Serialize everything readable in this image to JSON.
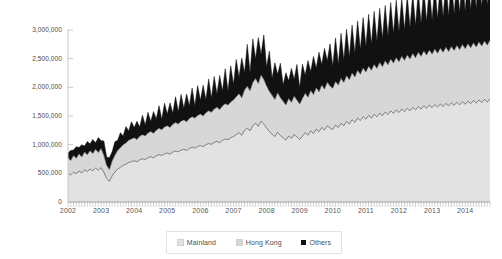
{
  "chart_data": {
    "type": "area",
    "title": "",
    "xlabel": "",
    "ylabel": "",
    "stacked": true,
    "grid": false,
    "legend_position": "bottom",
    "ylim": [
      0,
      3000000
    ],
    "ytick_labels": [
      "3,000,000",
      "2,500,000",
      "2,000,000",
      "1,500,000",
      "1,000,000",
      "500,000",
      "0"
    ],
    "ytick_values": [
      3000000,
      2500000,
      2000000,
      1500000,
      1000000,
      500000,
      0
    ],
    "xtick_labels": [
      "2002",
      "2003",
      "2004",
      "2005",
      "2006",
      "2007",
      "2008",
      "2009",
      "2010",
      "2011",
      "2012",
      "2013",
      "2014"
    ],
    "x_start_year": 2002,
    "x_end_year": 2014,
    "x_frequency": "monthly",
    "colors": {
      "mainland": "#e2e2e2",
      "hong_kong": "#d7d7d7",
      "others": "#111111",
      "axis": "#c8c8c8",
      "line": "#3a3a3a",
      "text": "#4d4d4d"
    },
    "series": [
      {
        "name": "Mainland",
        "color": "#e2e2e2",
        "values": [
          500000,
          470000,
          520000,
          495000,
          540000,
          505000,
          560000,
          530000,
          575000,
          545000,
          590000,
          555000,
          600000,
          520000,
          410000,
          360000,
          455000,
          520000,
          575000,
          605000,
          640000,
          660000,
          690000,
          705000,
          720000,
          700000,
          735000,
          755000,
          740000,
          775000,
          790000,
          770000,
          805000,
          825000,
          810000,
          840000,
          855000,
          835000,
          870000,
          890000,
          875000,
          905000,
          920000,
          900000,
          935000,
          955000,
          940000,
          970000,
          985000,
          965000,
          1000000,
          1020000,
          1005000,
          1040000,
          1060000,
          1035000,
          1075000,
          1100000,
          1085000,
          1120000,
          1140000,
          1175000,
          1210000,
          1165000,
          1250000,
          1290000,
          1240000,
          1330000,
          1375000,
          1320000,
          1410000,
          1360000,
          1290000,
          1230000,
          1185000,
          1140000,
          1215000,
          1160000,
          1120000,
          1080000,
          1150000,
          1110000,
          1175000,
          1135000,
          1090000,
          1150000,
          1210000,
          1165000,
          1240000,
          1195000,
          1270000,
          1225000,
          1300000,
          1255000,
          1330000,
          1290000,
          1265000,
          1340000,
          1300000,
          1375000,
          1330000,
          1405000,
          1360000,
          1435000,
          1390000,
          1465000,
          1420000,
          1490000,
          1445000,
          1510000,
          1465000,
          1530000,
          1485000,
          1550000,
          1505000,
          1570000,
          1525000,
          1590000,
          1545000,
          1605000,
          1560000,
          1620000,
          1575000,
          1635000,
          1590000,
          1650000,
          1605000,
          1665000,
          1620000,
          1680000,
          1635000,
          1690000,
          1645000,
          1700000,
          1655000,
          1710000,
          1665000,
          1720000,
          1675000,
          1730000,
          1685000,
          1740000,
          1695000,
          1750000,
          1705000,
          1760000,
          1715000,
          1770000,
          1725000,
          1780000,
          1735000,
          1790000,
          1745000,
          1800000
        ]
      },
      {
        "name": "Hong Kong",
        "color": "#d7d7d7",
        "values": [
          270000,
          255000,
          290000,
          270000,
          300000,
          280000,
          310000,
          295000,
          320000,
          300000,
          330000,
          310000,
          335000,
          295000,
          230000,
          205000,
          260000,
          295000,
          325000,
          340000,
          360000,
          370000,
          385000,
          395000,
          400000,
          390000,
          410000,
          420000,
          412000,
          430000,
          440000,
          428000,
          448000,
          460000,
          450000,
          468000,
          475000,
          465000,
          485000,
          495000,
          487000,
          505000,
          512000,
          500000,
          520000,
          532000,
          523000,
          540000,
          548000,
          537000,
          558000,
          570000,
          560000,
          580000,
          592000,
          578000,
          600000,
          615000,
          605000,
          625000,
          640000,
          660000,
          680000,
          655000,
          705000,
          730000,
          700000,
          755000,
          780000,
          748000,
          805000,
          775000,
          735000,
          700000,
          675000,
          648000,
          692000,
          660000,
          637000,
          614000,
          654000,
          630000,
          668000,
          645000,
          620000,
          654000,
          688000,
          662000,
          705000,
          679000,
          722000,
          696000,
          740000,
          713000,
          757000,
          733000,
          719000,
          762000,
          739000,
          782000,
          756000,
          799000,
          773000,
          816000,
          790000,
          833000,
          807000,
          847000,
          822000,
          859000,
          833000,
          870000,
          845000,
          882000,
          856000,
          893000,
          868000,
          904000,
          879000,
          913000,
          887000,
          921000,
          896000,
          930000,
          904000,
          938000,
          912000,
          947000,
          921000,
          955000,
          929000,
          961000,
          935000,
          967000,
          941000,
          972000,
          947000,
          978000,
          952000,
          984000,
          958000,
          989000,
          964000,
          995000,
          969000,
          1001000,
          975000,
          1006000,
          980000,
          1012000,
          986000,
          1017000,
          991000,
          1023000
        ]
      },
      {
        "name": "Others",
        "color": "#111111",
        "values": [
          85000,
          175000,
          95000,
          200000,
          110000,
          215000,
          105000,
          230000,
          120000,
          245000,
          115000,
          260000,
          135000,
          250000,
          145000,
          205000,
          160000,
          235000,
          175000,
          265000,
          150000,
          285000,
          165000,
          300000,
          180000,
          320000,
          165000,
          340000,
          190000,
          360000,
          175000,
          380000,
          200000,
          395000,
          185000,
          415000,
          205000,
          430000,
          195000,
          450000,
          215000,
          465000,
          205000,
          485000,
          225000,
          500000,
          215000,
          520000,
          240000,
          535000,
          225000,
          555000,
          250000,
          570000,
          235000,
          595000,
          260000,
          610000,
          245000,
          630000,
          275000,
          650000,
          290000,
          690000,
          305000,
          730000,
          320000,
          760000,
          345000,
          800000,
          360000,
          780000,
          330000,
          700000,
          300000,
          640000,
          320000,
          600000,
          290000,
          560000,
          310000,
          590000,
          300000,
          620000,
          285000,
          600000,
          315000,
          640000,
          330000,
          665000,
          345000,
          690000,
          360000,
          710000,
          375000,
          735000,
          390000,
          760000,
          370000,
          785000,
          395000,
          810000,
          400000,
          835000,
          420000,
          860000,
          435000,
          880000,
          450000,
          905000,
          460000,
          925000,
          475000,
          945000,
          490000,
          965000,
          505000,
          985000,
          515000,
          1000000,
          525000,
          1015000,
          535000,
          1035000,
          550000,
          1050000,
          560000,
          1070000,
          575000,
          1085000,
          585000,
          1095000,
          595000,
          1110000,
          605000,
          1125000,
          615000,
          1140000,
          625000,
          1155000,
          635000,
          1170000,
          645000,
          1180000,
          655000,
          1195000,
          665000,
          1205000,
          672000,
          1215000,
          680000,
          1225000,
          690000,
          1235000
        ]
      }
    ],
    "legend": [
      {
        "label": "Mainland",
        "color": "#e2e2e2"
      },
      {
        "label": "Hong Kong",
        "color": "#d7d7d7"
      },
      {
        "label": "Others",
        "color": "#111111"
      }
    ]
  }
}
